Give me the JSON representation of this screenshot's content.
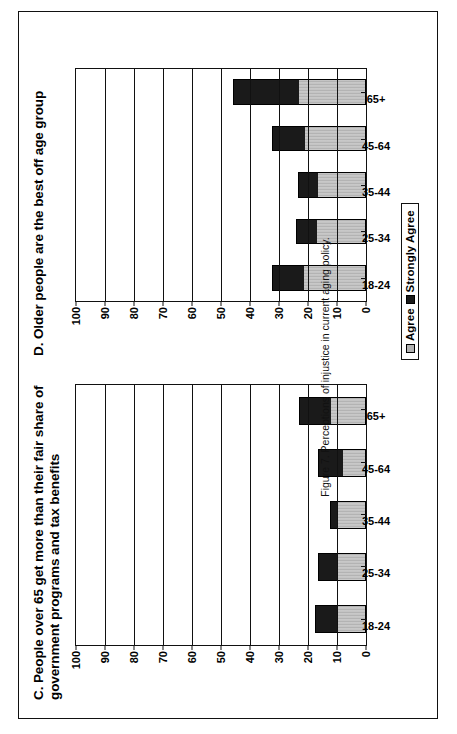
{
  "figure": {
    "caption": "Figure 7.  Perceptions of injustice in current aging policy."
  },
  "legend": {
    "agree_label": "Agree",
    "strongly_agree_label": "Strongly Agree",
    "agree_color": "#b3b3b3",
    "strongly_agree_color": "#1a1a1a"
  },
  "chart_data": [
    {
      "type": "bar",
      "id": "panel-c",
      "title": "C.  People over 65 get more than their fair share of government  programs and tax benefits",
      "stacked": true,
      "categories": [
        "18-24",
        "25-34",
        "35-44",
        "45-64",
        "65+"
      ],
      "series": [
        {
          "name": "Agree",
          "color": "#b3b3b3",
          "values": [
            10,
            10,
            9.5,
            8,
            12
          ]
        },
        {
          "name": "Strongly Agree",
          "color": "#1a1a1a",
          "values": [
            7.5,
            6.5,
            3,
            8.5,
            11
          ]
        }
      ],
      "totals": [
        17.5,
        16.5,
        12.5,
        16.5,
        23
      ],
      "xlabel": "",
      "ylabel": "",
      "ylim": [
        0,
        100
      ],
      "yticks": [
        0,
        10,
        20,
        30,
        40,
        50,
        60,
        70,
        80,
        90,
        100
      ],
      "grid": true,
      "legend_position": "below-right"
    },
    {
      "type": "bar",
      "id": "panel-d",
      "title": "D.  Older people are the best off age group",
      "stacked": true,
      "categories": [
        "18-24",
        "25-34",
        "35-44",
        "45-64",
        "65+"
      ],
      "series": [
        {
          "name": "Agree",
          "color": "#b3b3b3",
          "values": [
            21.5,
            17,
            16.5,
            21,
            23
          ]
        },
        {
          "name": "Strongly Agree",
          "color": "#1a1a1a",
          "values": [
            11,
            7,
            7,
            11.5,
            23
          ]
        }
      ],
      "totals": [
        32.5,
        24,
        23.5,
        32.5,
        46
      ],
      "xlabel": "",
      "ylabel": "",
      "ylim": [
        0,
        100
      ],
      "yticks": [
        0,
        10,
        20,
        30,
        40,
        50,
        60,
        70,
        80,
        90,
        100
      ],
      "grid": true,
      "legend_position": "below-right"
    }
  ]
}
